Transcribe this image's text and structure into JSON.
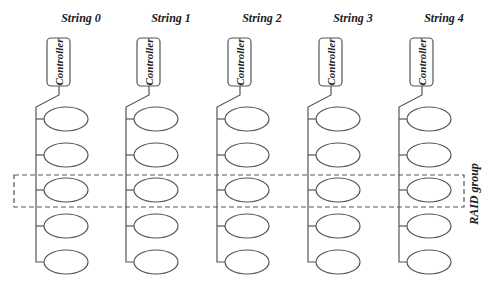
{
  "strings": [
    {
      "label": "String 0",
      "controller": "Controller",
      "disks": 5
    },
    {
      "label": "String 1",
      "controller": "Controller",
      "disks": 5
    },
    {
      "label": "String 2",
      "controller": "Controller",
      "disks": 5
    },
    {
      "label": "String 3",
      "controller": "Controller",
      "disks": 5
    },
    {
      "label": "String 4",
      "controller": "Controller",
      "disks": 5
    }
  ],
  "raid_group": {
    "label": "RAID group",
    "row_index": 2
  },
  "colors": {
    "line": "#555555",
    "text": "#222222",
    "background": "#ffffff"
  }
}
